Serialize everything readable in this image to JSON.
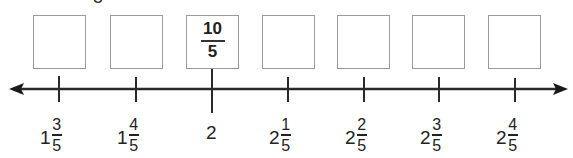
{
  "cropped_top_text": "5",
  "boxes": [
    {
      "id": 1,
      "x": 33,
      "value": ""
    },
    {
      "id": 2,
      "x": 110,
      "value": ""
    },
    {
      "id": 3,
      "x": 186,
      "value": {
        "numerator": "10",
        "denominator": "5"
      }
    },
    {
      "id": 4,
      "x": 262,
      "value": ""
    },
    {
      "id": 5,
      "x": 337,
      "value": ""
    },
    {
      "id": 6,
      "x": 412,
      "value": ""
    },
    {
      "id": 7,
      "x": 488,
      "value": ""
    }
  ],
  "number_line": {
    "arrows": "both",
    "color": "#2a2a2a",
    "ticks": [
      {
        "x": 59,
        "whole": "1",
        "numerator": "3",
        "denominator": "5"
      },
      {
        "x": 136,
        "whole": "1",
        "numerator": "4",
        "denominator": "5"
      },
      {
        "x": 212,
        "whole": "2",
        "numerator": "",
        "denominator": "",
        "major": true
      },
      {
        "x": 288,
        "whole": "2",
        "numerator": "1",
        "denominator": "5"
      },
      {
        "x": 364,
        "whole": "2",
        "numerator": "2",
        "denominator": "5"
      },
      {
        "x": 439,
        "whole": "2",
        "numerator": "3",
        "denominator": "5"
      },
      {
        "x": 515,
        "whole": "2",
        "numerator": "4",
        "denominator": "5"
      }
    ]
  }
}
